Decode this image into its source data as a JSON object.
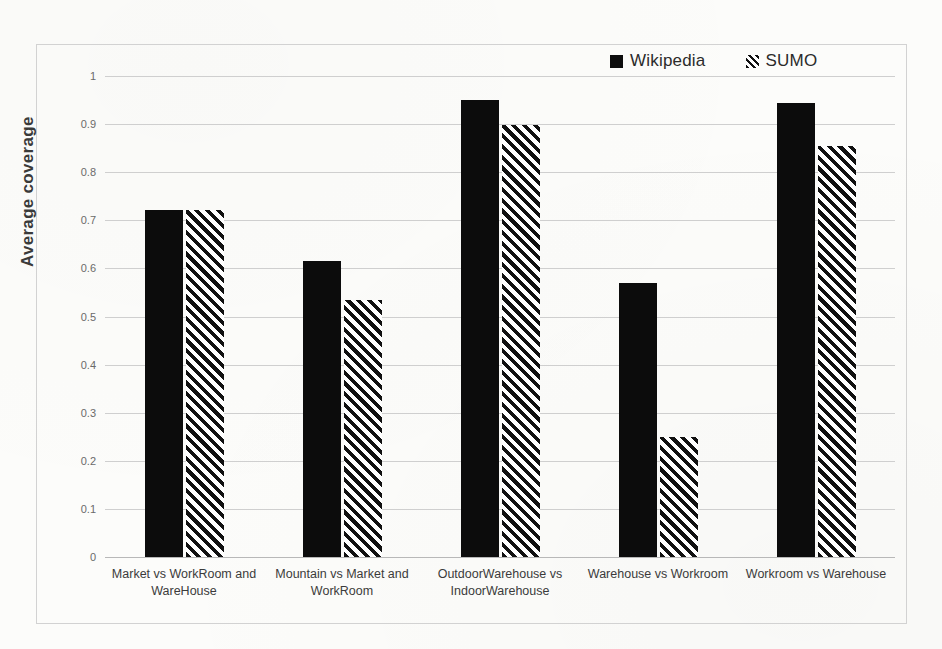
{
  "chart_data": {
    "type": "bar",
    "title": "",
    "subtitle": "",
    "xlabel": "",
    "ylabel": "Average coverage",
    "ylim": [
      0,
      1
    ],
    "ytick_labels": [
      "1",
      "0.9",
      "0.8",
      "0.7",
      "0.6",
      "0.5",
      "0.4",
      "0.3",
      "0.2",
      "0.1",
      "0"
    ],
    "ytick_values": [
      1,
      0.9,
      0.8,
      0.7,
      0.6,
      0.5,
      0.4,
      0.3,
      0.2,
      0.1,
      0
    ],
    "grid": true,
    "legend_position": "top-right",
    "categories": [
      "Market vs WorkRoom and WareHouse",
      "Mountain vs Market and WorkRoom",
      "OutdoorWarehouse vs IndoorWarehouse",
      "Warehouse vs Workroom",
      "Workroom vs Warehouse"
    ],
    "category_lines": [
      [
        "Market vs WorkRoom and",
        "WareHouse"
      ],
      [
        "Mountain vs Market and",
        "WorkRoom"
      ],
      [
        "OutdoorWarehouse vs",
        "IndoorWarehouse"
      ],
      [
        "Warehouse vs Workroom"
      ],
      [
        "Workroom vs Warehouse"
      ]
    ],
    "series": [
      {
        "name": "Wikipedia",
        "fill": "solid",
        "color": "#0c0c0c",
        "values": [
          0.722,
          0.615,
          0.95,
          0.57,
          0.944
        ]
      },
      {
        "name": "SUMO",
        "fill": "diagonal-hatch",
        "color": "#111111",
        "values": [
          0.722,
          0.535,
          0.898,
          0.25,
          0.854
        ]
      }
    ]
  },
  "legend": {
    "items": [
      {
        "label": "Wikipedia",
        "swatch": "solid-square-icon"
      },
      {
        "label": "SUMO",
        "swatch": "hatched-square-icon"
      }
    ]
  },
  "axes": {
    "y_title": "Average coverage"
  }
}
